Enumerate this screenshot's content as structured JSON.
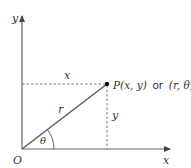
{
  "diagram": {
    "colors": {
      "axis": "#555555",
      "line": "#444444",
      "dashed": "#666666",
      "text": "#333333",
      "point": "#111111"
    },
    "axes": {
      "x_label": "x",
      "y_label": "y",
      "origin_label": "O"
    },
    "point": {
      "label_main": "P(x, y)",
      "label_or": "or",
      "label_polar": "(r, θ)"
    },
    "segments": {
      "horizontal_label": "x",
      "vertical_label": "y",
      "radius_label": "r",
      "angle_label": "θ"
    }
  }
}
